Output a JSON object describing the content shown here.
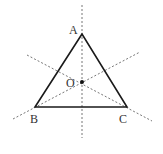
{
  "figure": {
    "type": "geometry-diagram",
    "colors": {
      "stroke": "#1a1a1a",
      "dashed": "#666666",
      "label": "#333333",
      "background": "#ffffff"
    },
    "points": {
      "A": {
        "label": "A",
        "x": 82,
        "y": 34
      },
      "B": {
        "label": "B",
        "x": 35,
        "y": 107
      },
      "C": {
        "label": "C",
        "x": 127,
        "y": 107
      },
      "O": {
        "label": "O",
        "x": 82,
        "y": 82
      }
    },
    "axes": [
      {
        "name": "axis-through-A",
        "x1": 82,
        "y1": 5,
        "x2": 82,
        "y2": 138
      },
      {
        "name": "axis-through-B",
        "x1": 13,
        "y1": 119,
        "x2": 140,
        "y2": 52
      },
      {
        "name": "axis-through-C",
        "x1": 27,
        "y1": 55,
        "x2": 152,
        "y2": 121
      }
    ]
  }
}
